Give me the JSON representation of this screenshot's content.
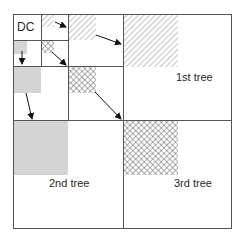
{
  "diagram": {
    "labels": {
      "dc": "DC",
      "tree1": "1st tree",
      "tree2": "2nd tree",
      "tree3": "3rd tree"
    },
    "colors": {
      "line": "#555555",
      "gray_fill": "#d4d4d4",
      "hatch": "#8a8a8a",
      "crosshatch": "#555555",
      "arrow": "#111111",
      "text": "#2a2a2a"
    },
    "subbands": [
      {
        "name": "DC",
        "level": 3,
        "pattern": "none"
      },
      {
        "name": "level-3 horizontal",
        "level": 3,
        "pattern": "diagonal-hatch"
      },
      {
        "name": "level-3 vertical",
        "level": 3,
        "pattern": "gray"
      },
      {
        "name": "level-3 diagonal",
        "level": 3,
        "pattern": "cross-hatch"
      },
      {
        "name": "level-2 horizontal",
        "level": 2,
        "pattern": "diagonal-hatch"
      },
      {
        "name": "level-2 vertical",
        "level": 2,
        "pattern": "gray"
      },
      {
        "name": "level-2 diagonal",
        "level": 2,
        "pattern": "cross-hatch"
      },
      {
        "name": "level-1 horizontal (1st tree)",
        "level": 1,
        "pattern": "diagonal-hatch"
      },
      {
        "name": "level-1 vertical (2nd tree)",
        "level": 1,
        "pattern": "gray"
      },
      {
        "name": "level-1 diagonal (3rd tree)",
        "level": 1,
        "pattern": "cross-hatch"
      }
    ]
  }
}
